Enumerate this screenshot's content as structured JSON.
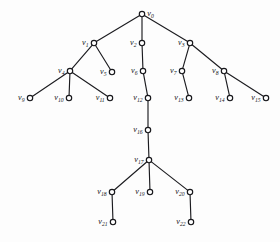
{
  "diagram": {
    "kind": "rooted-tree-graph",
    "title": "",
    "node_count": 23,
    "edge_count": 22,
    "colors": {
      "background": "#fdfdfd",
      "edge": "#1c1c20",
      "node_stroke": "#17171b",
      "node_fill": "#ffffff",
      "label": "#161619"
    },
    "nodes": [
      {
        "id": "v0",
        "letter": "v",
        "index": "0",
        "x": 142,
        "y": 14,
        "label_side": "right"
      },
      {
        "id": "v1",
        "letter": "v",
        "index": "1",
        "x": 94,
        "y": 43,
        "label_side": "left"
      },
      {
        "id": "v2",
        "letter": "v",
        "index": "2",
        "x": 142,
        "y": 43,
        "label_side": "left"
      },
      {
        "id": "v3",
        "letter": "v",
        "index": "3",
        "x": 190,
        "y": 43,
        "label_side": "left"
      },
      {
        "id": "v4",
        "letter": "v",
        "index": "4",
        "x": 70,
        "y": 71,
        "label_side": "left"
      },
      {
        "id": "v5",
        "letter": "v",
        "index": "5",
        "x": 112,
        "y": 72,
        "label_side": "left"
      },
      {
        "id": "v6",
        "letter": "v",
        "index": "6",
        "x": 143,
        "y": 71,
        "label_side": "left"
      },
      {
        "id": "v7",
        "letter": "v",
        "index": "7",
        "x": 182,
        "y": 71,
        "label_side": "left"
      },
      {
        "id": "v8",
        "letter": "v",
        "index": "8",
        "x": 224,
        "y": 71,
        "label_side": "left"
      },
      {
        "id": "v9",
        "letter": "v",
        "index": "9",
        "x": 30,
        "y": 98,
        "label_side": "left"
      },
      {
        "id": "v10",
        "letter": "v",
        "index": "10",
        "x": 69,
        "y": 98,
        "label_side": "left"
      },
      {
        "id": "v11",
        "letter": "v",
        "index": "11",
        "x": 110,
        "y": 98,
        "label_side": "left"
      },
      {
        "id": "v12",
        "letter": "v",
        "index": "12",
        "x": 148,
        "y": 98,
        "label_side": "left"
      },
      {
        "id": "v13",
        "letter": "v",
        "index": "13",
        "x": 189,
        "y": 98,
        "label_side": "left"
      },
      {
        "id": "v14",
        "letter": "v",
        "index": "14",
        "x": 230,
        "y": 98,
        "label_side": "left"
      },
      {
        "id": "v15",
        "letter": "v",
        "index": "15",
        "x": 266,
        "y": 98,
        "label_side": "left"
      },
      {
        "id": "v16",
        "letter": "v",
        "index": "16",
        "x": 148,
        "y": 130,
        "label_side": "left"
      },
      {
        "id": "v17",
        "letter": "v",
        "index": "17",
        "x": 149,
        "y": 160,
        "label_side": "left"
      },
      {
        "id": "v18",
        "letter": "v",
        "index": "18",
        "x": 112,
        "y": 192,
        "label_side": "left"
      },
      {
        "id": "v19",
        "letter": "v",
        "index": "19",
        "x": 150,
        "y": 192,
        "label_side": "left"
      },
      {
        "id": "v20",
        "letter": "v",
        "index": "20",
        "x": 190,
        "y": 192,
        "label_side": "left"
      },
      {
        "id": "v21",
        "letter": "v",
        "index": "21",
        "x": 113,
        "y": 222,
        "label_side": "left"
      },
      {
        "id": "v22",
        "letter": "v",
        "index": "22",
        "x": 191,
        "y": 222,
        "label_side": "left"
      }
    ],
    "edges": [
      {
        "from": "v0",
        "to": "v1"
      },
      {
        "from": "v0",
        "to": "v2"
      },
      {
        "from": "v0",
        "to": "v3"
      },
      {
        "from": "v1",
        "to": "v4"
      },
      {
        "from": "v1",
        "to": "v5"
      },
      {
        "from": "v2",
        "to": "v6"
      },
      {
        "from": "v3",
        "to": "v7"
      },
      {
        "from": "v3",
        "to": "v8"
      },
      {
        "from": "v4",
        "to": "v9"
      },
      {
        "from": "v4",
        "to": "v10"
      },
      {
        "from": "v4",
        "to": "v11"
      },
      {
        "from": "v6",
        "to": "v12"
      },
      {
        "from": "v7",
        "to": "v13"
      },
      {
        "from": "v8",
        "to": "v14"
      },
      {
        "from": "v8",
        "to": "v15"
      },
      {
        "from": "v12",
        "to": "v16"
      },
      {
        "from": "v16",
        "to": "v17"
      },
      {
        "from": "v17",
        "to": "v18"
      },
      {
        "from": "v17",
        "to": "v19"
      },
      {
        "from": "v17",
        "to": "v20"
      },
      {
        "from": "v18",
        "to": "v21"
      },
      {
        "from": "v20",
        "to": "v22"
      }
    ]
  }
}
